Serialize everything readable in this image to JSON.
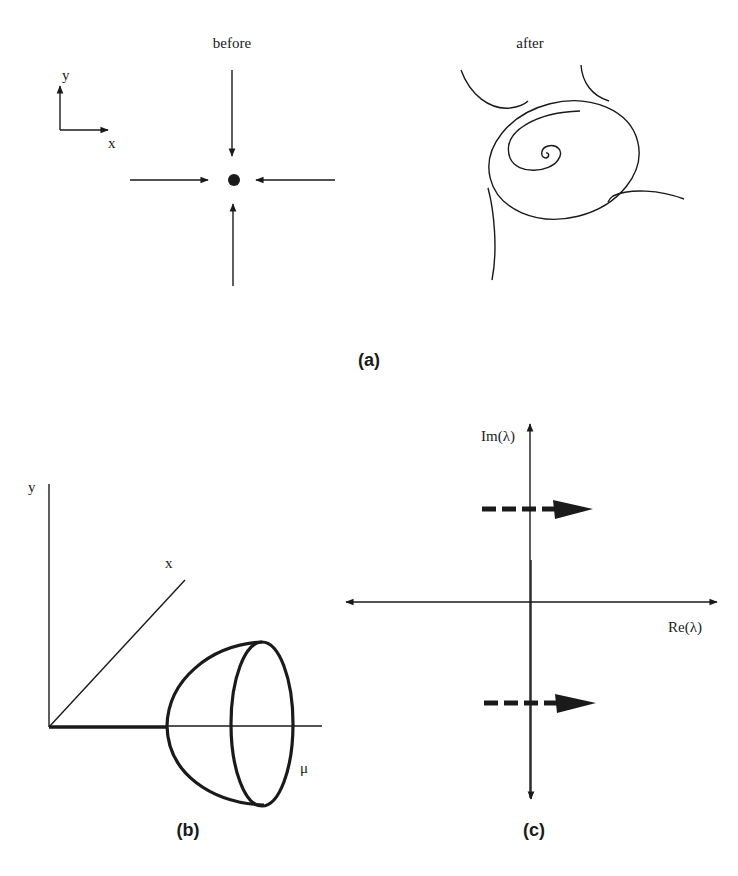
{
  "figure": {
    "panels": [
      {
        "id": "a",
        "caption": "(a)",
        "subpanels": [
          {
            "title": "before",
            "axes_labels": {
              "x": "x",
              "y": "y"
            },
            "description": "Stable fixed point with four trajectories approaching along the axes"
          },
          {
            "title": "after",
            "description": "Unstable spiral from fixed point converging onto a limit cycle, outer trajectories approaching the cycle"
          }
        ]
      },
      {
        "id": "b",
        "caption": "(b)",
        "axes_labels": {
          "y": "y",
          "x": "x",
          "mu": "μ"
        },
        "description": "Bifurcation diagram: branch of fixed points along μ-axis opening into a paraboloid of limit cycles"
      },
      {
        "id": "c",
        "caption": "(c)",
        "axes_labels": {
          "im": "Im(λ)",
          "re": "Re(λ)"
        },
        "description": "Complex-conjugate eigenvalue pair crossing the imaginary axis from left to right"
      }
    ]
  }
}
